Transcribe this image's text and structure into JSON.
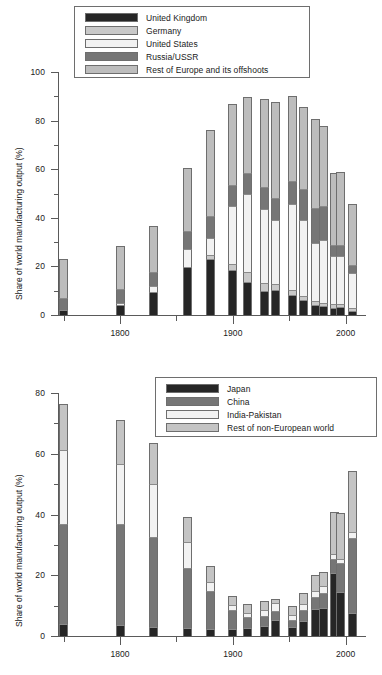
{
  "figure": {
    "title": "",
    "ylabel": "Share of world manufacturing output (%)"
  },
  "chart_data": [
    {
      "id": "top",
      "type": "bar",
      "stacked": true,
      "title": "",
      "xlabel": "",
      "ylabel": "Share of world manufacturing output (%)",
      "xlim": [
        1745,
        2018
      ],
      "ylim": [
        0,
        100
      ],
      "ytick_values": [
        0,
        20,
        40,
        60,
        80,
        100
      ],
      "ytick_labels": [
        "0",
        "20",
        "40",
        "60",
        "80",
        "100"
      ],
      "yminor_values": [
        10,
        30,
        50,
        70,
        90
      ],
      "xtick_values": [
        1800,
        1900,
        2000
      ],
      "xtick_labels": [
        "1800",
        "1900",
        "2000"
      ],
      "xminor_values": [
        1750,
        1850,
        1950
      ],
      "grid": false,
      "legend_position": "upper-left",
      "legend": [
        {
          "name": "United Kingdom",
          "color": "#262626"
        },
        {
          "name": "Germany",
          "color": "#c9c9c9"
        },
        {
          "name": "United States",
          "color": "#f2f2f2"
        },
        {
          "name": "Russia/USSR",
          "color": "#767676"
        },
        {
          "name": "Rest of Europe and its offshoots",
          "color": "#bdbdbd"
        }
      ],
      "series": [
        {
          "name": "United Kingdom",
          "values": [
            1.9,
            4.3,
            9.5,
            19.9,
            22.9,
            18.5,
            13.6,
            9.8,
            10.3,
            8.4,
            6.2,
            4.3,
            3.6,
            3.0,
            3.3,
            1.6
          ]
        },
        {
          "name": "Germany",
          "values": [
            0.0,
            0.0,
            0.0,
            0.0,
            1.7,
            2.6,
            4.0,
            3.5,
            2.3,
            1.7,
            1.6,
            1.4,
            1.4,
            1.4,
            1.3,
            1.3
          ]
        },
        {
          "name": "United States",
          "values": [
            0.1,
            0.8,
            2.4,
            7.2,
            7.2,
            23.6,
            32.0,
            30.2,
            26.5,
            35.4,
            31.2,
            24.0,
            25.8,
            19.9,
            19.5,
            14.2
          ]
        },
        {
          "name": "Russia/USSR",
          "values": [
            5.0,
            5.6,
            5.6,
            7.6,
            8.8,
            8.8,
            8.8,
            9.0,
            8.9,
            9.5,
            12.8,
            14.5,
            14.0,
            4.6,
            4.8,
            3.4
          ]
        },
        {
          "name": "Rest of Europe and its offshoots",
          "values": [
            16.2,
            17.9,
            19.0,
            25.6,
            35.7,
            33.2,
            31.2,
            36.5,
            39.5,
            35.0,
            34.0,
            36.5,
            33.0,
            29.6,
            30.0,
            25.0
          ]
        }
      ],
      "x": [
        1750,
        1800,
        1830,
        1860,
        1880,
        1900,
        1913,
        1928,
        1938,
        1953,
        1963,
        1973,
        1980,
        1990,
        1995,
        2006
      ],
      "totals": [
        23.2,
        28.6,
        36.5,
        60.3,
        76.3,
        86.7,
        89.6,
        89.0,
        87.5,
        90.0,
        85.8,
        80.7,
        77.8,
        58.5,
        58.9,
        45.5
      ]
    },
    {
      "id": "bottom",
      "type": "bar",
      "stacked": true,
      "title": "",
      "xlabel": "",
      "ylabel": "Share of world manufacturing output (%)",
      "xlim": [
        1745,
        2018
      ],
      "ylim": [
        0,
        80
      ],
      "ytick_values": [
        0,
        20,
        40,
        60,
        80
      ],
      "ytick_labels": [
        "0",
        "20",
        "40",
        "60",
        "80"
      ],
      "yminor_values": [
        10,
        30,
        50,
        70
      ],
      "xtick_values": [
        1800,
        1900,
        2000
      ],
      "xtick_labels": [
        "1800",
        "1900",
        "2000"
      ],
      "xminor_values": [
        1750,
        1850,
        1950
      ],
      "grid": false,
      "legend_position": "upper-right",
      "legend": [
        {
          "name": "Japan",
          "color": "#262626"
        },
        {
          "name": "China",
          "color": "#767676"
        },
        {
          "name": "India-Pakistan",
          "color": "#f2f2f2"
        },
        {
          "name": "Rest of non-European world",
          "color": "#c4c4c4"
        }
      ],
      "series": [
        {
          "name": "Japan",
          "values": [
            3.8,
            3.5,
            2.8,
            2.6,
            2.4,
            2.4,
            2.7,
            3.3,
            5.2,
            2.9,
            5.1,
            8.8,
            9.1,
            20.7,
            14.6,
            7.6
          ]
        },
        {
          "name": "China",
          "values": [
            33.0,
            33.3,
            29.8,
            19.7,
            12.5,
            6.2,
            3.6,
            3.4,
            3.1,
            2.3,
            3.5,
            3.9,
            5.0,
            4.6,
            9.4,
            24.6
          ]
        },
        {
          "name": "India-Pakistan",
          "values": [
            24.5,
            19.7,
            17.6,
            8.6,
            2.8,
            1.7,
            1.4,
            1.9,
            2.4,
            1.7,
            1.8,
            2.1,
            2.3,
            1.6,
            1.2,
            2.2
          ]
        },
        {
          "name": "Rest of non-European world",
          "values": [
            15.2,
            14.5,
            13.2,
            8.2,
            5.5,
            3.0,
            2.8,
            2.8,
            1.5,
            2.9,
            3.7,
            5.3,
            4.8,
            13.9,
            15.2,
            20.0
          ]
        }
      ],
      "x": [
        1750,
        1800,
        1830,
        1860,
        1880,
        1900,
        1913,
        1928,
        1938,
        1953,
        1963,
        1973,
        1980,
        1990,
        1995,
        2006
      ],
      "totals": [
        76.5,
        71.0,
        63.4,
        39.1,
        23.2,
        13.3,
        10.5,
        11.4,
        12.2,
        9.8,
        14.1,
        20.1,
        21.2,
        40.8,
        40.4,
        54.4
      ]
    }
  ]
}
